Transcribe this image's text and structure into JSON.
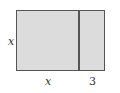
{
  "diagram": {
    "shape": "rectangle split into two parts",
    "fill_color": "#dcdcdc",
    "stroke_color": "#555555",
    "labels": {
      "left_side": "x",
      "bottom_left_segment": "x",
      "bottom_right_segment": "3"
    }
  }
}
